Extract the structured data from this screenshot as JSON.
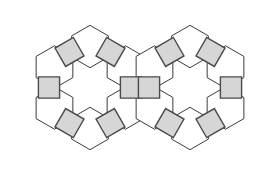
{
  "figure": {
    "type": "geometric-tiling-diagram",
    "canvas": {
      "width": 280,
      "height": 175
    },
    "background_color": "#ffffff"
  },
  "chart_data": {
    "type": "diagram",
    "vertex_configuration": "3.4.6.4",
    "ring_count": 2,
    "hexagons_per_ring": 6,
    "squares_per_ring": 6,
    "shared_squares": 1,
    "total_hexagons": 12,
    "total_squares": 11,
    "ring_centers": [
      {
        "label": "left-ring",
        "cx": 90,
        "cy": 87.5
      },
      {
        "label": "right-ring",
        "cx": 190,
        "cy": 87.5
      }
    ],
    "ring_radius": 41,
    "square_side": 21.2,
    "hexagon_circumradius": 21.2,
    "square_angles_deg": [
      0,
      60,
      120,
      180,
      240,
      300
    ],
    "hexagon_angles_deg": [
      30,
      90,
      150,
      210,
      270,
      330
    ],
    "colors": {
      "hexagon_fill": "#ffffff",
      "hexagon_stroke": "#3c3c3c",
      "square_fill": "#d6d6d6",
      "square_stroke": "#4a4a4a",
      "background": "#ffffff"
    }
  }
}
